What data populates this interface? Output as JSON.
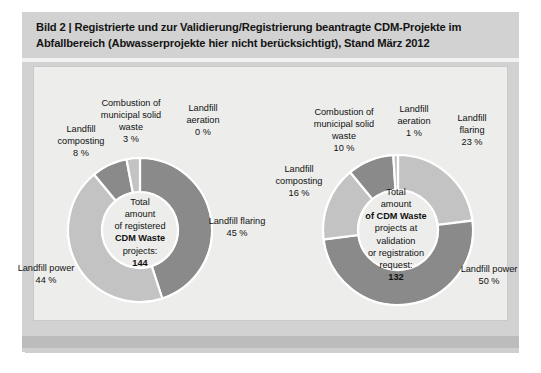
{
  "figure": {
    "caption_label": "Bild 2 |",
    "caption": "Bild 2 | Registrierte und zur Validierung/Registrierung beantragte CDM-Projekte im Abfallbereich (Abwasserprojekte hier nicht berücksichtigt), Stand März 2012"
  },
  "colors": {
    "dark_segment": "#8a8a8a",
    "light_segment": "#c3c3c3",
    "separator": "#ffffff",
    "panel_background": "#ededeb",
    "card_background": "#d2d2d2"
  },
  "left_chart": {
    "center": {
      "line1": "Total",
      "line2": "amount",
      "line3": "of registered",
      "line4": "CDM Waste",
      "line5": "projects:",
      "total": "144"
    },
    "labels": {
      "combustion": "Combustion of municipal solid waste",
      "combustion_pct": "3 %",
      "aeration": "Landfill aeration",
      "aeration_pct": "0 %",
      "composting": "Landfill composting",
      "composting_pct": "8 %",
      "flaring": "Landfill flaring",
      "flaring_pct": "45 %",
      "power": "Landfill power",
      "power_pct": "44 %"
    }
  },
  "right_chart": {
    "center": {
      "line1": "Total",
      "line2": "amount",
      "line3": "of CDM Waste",
      "line4": "projects at",
      "line5": "validation",
      "line6": "or registration",
      "line7": "request:",
      "total": "132"
    },
    "labels": {
      "combustion": "Combustion of municipal solid waste",
      "combustion_pct": "10 %",
      "aeration": "Landfill aeration",
      "aeration_pct": "1 %",
      "composting": "Landfill composting",
      "composting_pct": "16 %",
      "flaring": "Landfill flaring",
      "flaring_pct": "23 %",
      "power": "Landfill power",
      "power_pct": "50 %"
    }
  },
  "chart_data": [
    {
      "type": "pie",
      "variant": "donut",
      "title": "Total amount of registered CDM Waste projects: 144",
      "total": 144,
      "unit": "%",
      "start_angle_deg": 0,
      "direction": "clockwise",
      "legend": "none-inline-labels",
      "categories": [
        "Landfill flaring",
        "Landfill power",
        "Landfill composting",
        "Combustion of municipal solid waste",
        "Landfill aeration"
      ],
      "values": [
        45,
        44,
        8,
        3,
        0
      ],
      "labels": [
        "45 %",
        "44 %",
        "8 %",
        "3 %",
        "0 %"
      ],
      "colors": [
        "#8a8a8a",
        "#c3c3c3",
        "#8a8a8a",
        "#c3c3c3",
        "#c3c3c3"
      ]
    },
    {
      "type": "pie",
      "variant": "donut",
      "title": "Total amount of CDM Waste projects at validation or registration request: 132",
      "total": 132,
      "unit": "%",
      "start_angle_deg": 0,
      "direction": "clockwise",
      "legend": "none-inline-labels",
      "categories": [
        "Landfill flaring",
        "Landfill power",
        "Landfill composting",
        "Combustion of municipal solid waste",
        "Landfill aeration"
      ],
      "values": [
        23,
        50,
        16,
        10,
        1
      ],
      "labels": [
        "23 %",
        "50 %",
        "16 %",
        "10 %",
        "1 %"
      ],
      "colors": [
        "#c3c3c3",
        "#8a8a8a",
        "#c3c3c3",
        "#8a8a8a",
        "#c3c3c3"
      ]
    }
  ]
}
